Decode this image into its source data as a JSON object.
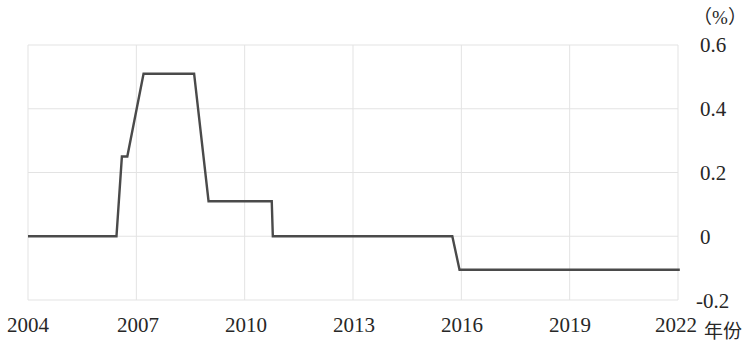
{
  "chart_data": {
    "type": "line",
    "title": "",
    "subtitle": "",
    "xlabel": "年份",
    "ylabel": "",
    "unit_label": "（%）",
    "xlim": [
      2004,
      2022
    ],
    "ylim": [
      -0.2,
      0.6
    ],
    "grid": true,
    "legend": null,
    "line_color": "#4a4a4a",
    "grid_color": "#e3e3e3",
    "x_ticks": [
      "2004",
      "2007",
      "2010",
      "2013",
      "2016",
      "2019",
      "2022"
    ],
    "x_tick_values": [
      2004,
      2007,
      2010,
      2013,
      2016,
      2019,
      2022
    ],
    "y_ticks": [
      "0.6",
      "0.4",
      "0.2",
      "0",
      "-0.2"
    ],
    "y_tick_values": [
      0.6,
      0.4,
      0.2,
      0,
      -0.2
    ],
    "step_style": "stepped-with-slanted-transitions",
    "series": [
      {
        "name": "利率",
        "x": [
          2004.0,
          2006.45,
          2006.6,
          2006.75,
          2007.2,
          2008.6,
          2009.0,
          2010.75,
          2010.78,
          2015.75,
          2015.95,
          2022.05
        ],
        "y": [
          0.0,
          0.0,
          0.25,
          0.25,
          0.51,
          0.51,
          0.11,
          0.11,
          0.0,
          0.0,
          -0.105,
          -0.105
        ]
      }
    ],
    "annotations": []
  }
}
